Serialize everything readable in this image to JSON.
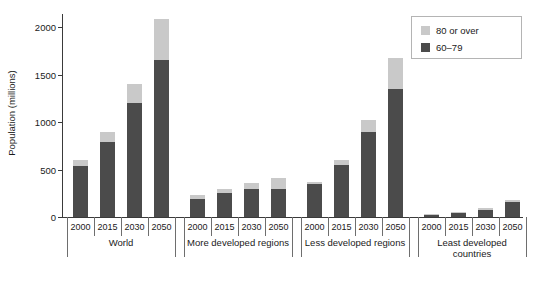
{
  "chart_data": {
    "type": "bar",
    "stacked": true,
    "title": "",
    "subtitle": "",
    "xlabel": "",
    "ylabel": "Population (millions)",
    "ylim": [
      0,
      2200
    ],
    "yticks": [
      0,
      500,
      1000,
      1500,
      2000
    ],
    "ytick_labels": [
      "0",
      "500",
      "1000",
      "1500",
      "2000"
    ],
    "grid": false,
    "legend_position": "top-right",
    "legend": [
      "80 or over",
      "60–79"
    ],
    "series": [
      {
        "name": "60–79",
        "color": "#4b4b4b",
        "values": [
          540,
          790,
          1200,
          1650,
          190,
          250,
          300,
          290,
          350,
          545,
          900,
          1350,
          28,
          42,
          78,
          155
        ]
      },
      {
        "name": "80 or over",
        "color": "#c9c9c9",
        "values": [
          60,
          100,
          200,
          430,
          40,
          45,
          55,
          120,
          20,
          55,
          120,
          320,
          4,
          6,
          12,
          25
        ]
      }
    ],
    "totals": [
      600,
      890,
      1400,
      2080,
      230,
      295,
      355,
      410,
      370,
      600,
      1020,
      1670,
      32,
      48,
      90,
      180
    ],
    "categories": [
      "2000",
      "2015",
      "2030",
      "2050",
      "2000",
      "2015",
      "2030",
      "2050",
      "2000",
      "2015",
      "2030",
      "2050",
      "2000",
      "2015",
      "2030",
      "2050"
    ],
    "groups": [
      {
        "label": "World",
        "years": [
          "2000",
          "2015",
          "2030",
          "2050"
        ]
      },
      {
        "label": "More developed regions",
        "years": [
          "2000",
          "2015",
          "2030",
          "2050"
        ]
      },
      {
        "label": "Less developed regions",
        "years": [
          "2000",
          "2015",
          "2030",
          "2050"
        ]
      },
      {
        "label": "Least developed countries",
        "years": [
          "2000",
          "2015",
          "2030",
          "2050"
        ]
      }
    ]
  },
  "axis": {
    "y_title": "Population (millions)"
  },
  "legend": {
    "items": [
      {
        "label": "80 or over",
        "color": "#c9c9c9"
      },
      {
        "label": "60–79",
        "color": "#4b4b4b"
      }
    ]
  },
  "colors": {
    "series_high": "#c9c9c9",
    "series_low": "#4b4b4b",
    "axis": "#3a3a3a",
    "text": "#1a1a1a",
    "separator": "#6e6e6e",
    "legend_border": "#b4b4b4",
    "background": "#ffffff"
  }
}
